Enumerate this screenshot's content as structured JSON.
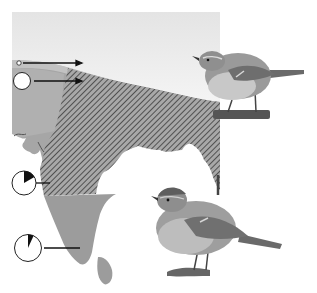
{
  "figure": {
    "type": "distribution-map",
    "region": "Indian subcontinent",
    "colors": {
      "background": "#ffffff",
      "himalaya_snow": "#ececec",
      "land": "#9b9b9b",
      "land_light": "#b4b4b4",
      "hatch": "#3a3a3a",
      "marker_fill": "#ffffff",
      "marker_stroke": "#222222",
      "arrow": "#111111"
    },
    "markers": [
      {
        "id": "marker-1",
        "kind": "small-circle",
        "pie_fraction": 0.0,
        "label": ""
      },
      {
        "id": "marker-2",
        "kind": "large-circle",
        "pie_fraction": 0.0,
        "label": ""
      },
      {
        "id": "marker-3",
        "kind": "pie",
        "pie_fraction": 0.2,
        "label": ""
      },
      {
        "id": "marker-4",
        "kind": "pie",
        "pie_fraction": 0.07,
        "label": ""
      }
    ],
    "birds": [
      {
        "id": "bird-top",
        "description": "warbler perched on branch, facing left"
      },
      {
        "id": "bird-bottom",
        "description": "warbler perched on twig, facing left"
      }
    ]
  }
}
